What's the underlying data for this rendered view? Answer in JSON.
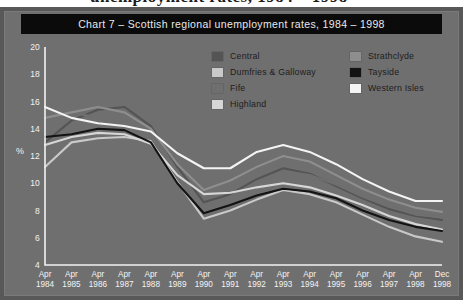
{
  "page": {
    "bleed_text": "unemployment rates, 1984 – 1998",
    "background_color": "#6e6e6e",
    "frame_color": "#585858"
  },
  "title": {
    "text": "Chart 7 – Scottish regional unemployment rates, 1984 – 1998",
    "bar_color": "#0b0b0b",
    "text_color": "#e9e9e9"
  },
  "legend": {
    "items": [
      {
        "label": "Central",
        "color": "#545454",
        "column": "left"
      },
      {
        "label": "Dumfries & Galloway",
        "color": "#c9c9c9",
        "column": "left"
      },
      {
        "label": "Fife",
        "color": "#6f6f6f",
        "column": "left"
      },
      {
        "label": "Highland",
        "color": "#d6d6d6",
        "column": "left"
      },
      {
        "label": "Strathclyde",
        "color": "#8e8e8e",
        "column": "right"
      },
      {
        "label": "Tayside",
        "color": "#131313",
        "column": "right"
      },
      {
        "label": "Western Isles",
        "color": "#f4f4f4",
        "column": "right"
      }
    ]
  },
  "axes": {
    "ylabel": "%",
    "yticks": [
      20,
      18,
      16,
      14,
      12,
      10,
      8,
      6,
      4
    ],
    "ylim": [
      4,
      20
    ],
    "axis_color": "#f2f2f2"
  },
  "chart_data": {
    "type": "line",
    "title": "Chart 7 – Scottish regional unemployment rates, 1984 – 1998",
    "xlabel": "",
    "ylabel": "%",
    "ylim": [
      4,
      20
    ],
    "yticks": [
      4,
      6,
      8,
      10,
      12,
      14,
      16,
      18,
      20
    ],
    "grid": false,
    "legend_position": "top-right-inside",
    "x": [
      "Apr 1984",
      "Apr 1985",
      "Apr 1986",
      "Apr 1987",
      "Apr 1988",
      "Apr 1989",
      "Apr 1990",
      "Apr 1991",
      "Apr 1992",
      "Apr 1993",
      "Apr 1994",
      "Apr 1995",
      "Apr 1996",
      "Apr 1997",
      "Apr 1998",
      "Dec 1998"
    ],
    "x_tick_lines": [
      [
        "Apr",
        "1984"
      ],
      [
        "Apr",
        "1985"
      ],
      [
        "Apr",
        "1986"
      ],
      [
        "Apr",
        "1987"
      ],
      [
        "Apr",
        "1988"
      ],
      [
        "Apr",
        "1989"
      ],
      [
        "Apr",
        "1990"
      ],
      [
        "Apr",
        "1991"
      ],
      [
        "Apr",
        "1992"
      ],
      [
        "Apr",
        "1993"
      ],
      [
        "Apr",
        "1994"
      ],
      [
        "Apr",
        "1995"
      ],
      [
        "Apr",
        "1996"
      ],
      [
        "Apr",
        "1997"
      ],
      [
        "Apr",
        "1998"
      ],
      [
        "Dec",
        "1998"
      ]
    ],
    "series": [
      {
        "name": "Central",
        "color": "#545454",
        "values": [
          13.0,
          14.6,
          15.4,
          15.6,
          14.2,
          11.2,
          8.6,
          9.2,
          10.3,
          11.1,
          10.7,
          9.8,
          8.9,
          8.1,
          7.6,
          7.3
        ]
      },
      {
        "name": "Dumfries & Galloway",
        "color": "#c9c9c9",
        "values": [
          11.2,
          13.0,
          13.3,
          13.4,
          13.1,
          10.1,
          7.4,
          8.0,
          8.8,
          9.5,
          9.2,
          8.6,
          7.7,
          6.8,
          6.1,
          5.7
        ]
      },
      {
        "name": "Fife",
        "color": "#6f6f6f",
        "values": [
          15.6,
          15.2,
          14.8,
          14.4,
          13.4,
          10.4,
          8.3,
          9.0,
          10.1,
          10.9,
          10.6,
          9.9,
          9.0,
          8.3,
          7.7,
          7.5
        ]
      },
      {
        "name": "Highland",
        "color": "#d6d6d6",
        "values": [
          12.8,
          13.4,
          13.7,
          13.6,
          12.9,
          10.6,
          9.2,
          9.3,
          9.7,
          10.0,
          9.7,
          9.1,
          8.4,
          7.6,
          7.0,
          6.6
        ]
      },
      {
        "name": "Strathclyde",
        "color": "#8e8e8e",
        "values": [
          14.8,
          15.2,
          15.6,
          15.2,
          14.0,
          11.4,
          9.5,
          10.2,
          11.2,
          12.0,
          11.6,
          10.6,
          9.6,
          8.8,
          8.2,
          7.9
        ]
      },
      {
        "name": "Tayside",
        "color": "#131313",
        "values": [
          13.4,
          13.6,
          14.0,
          13.9,
          13.0,
          10.0,
          7.8,
          8.4,
          9.1,
          9.6,
          9.4,
          8.9,
          8.0,
          7.3,
          6.8,
          6.5
        ]
      },
      {
        "name": "Western Isles",
        "color": "#f4f4f4",
        "values": [
          15.6,
          14.8,
          14.4,
          14.2,
          13.8,
          12.2,
          11.1,
          11.1,
          12.3,
          12.8,
          12.3,
          11.4,
          10.3,
          9.4,
          8.7,
          8.7
        ]
      }
    ]
  }
}
